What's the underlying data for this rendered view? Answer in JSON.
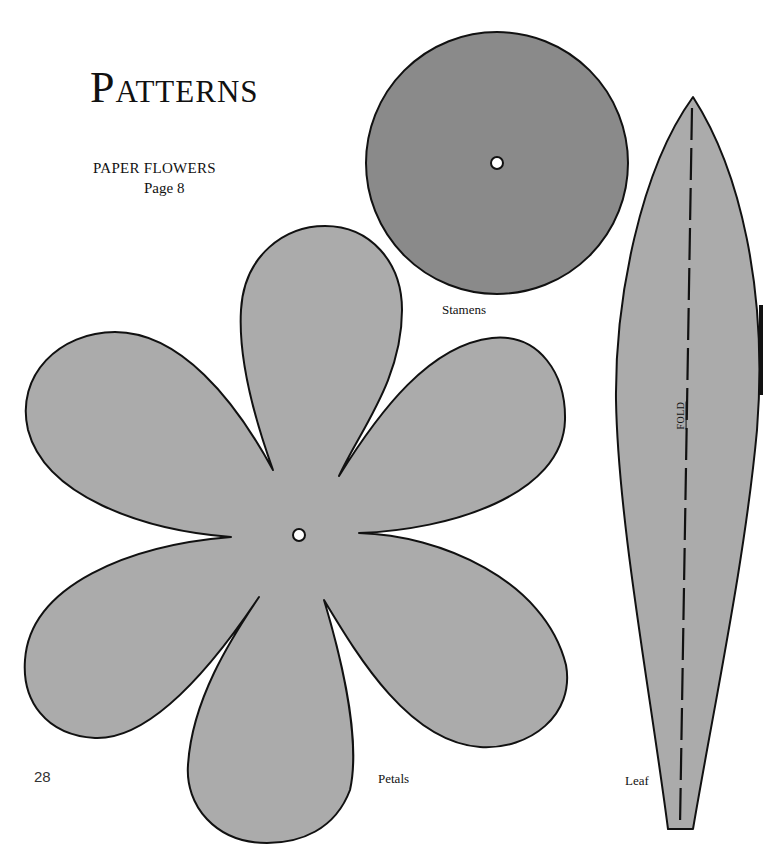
{
  "page": {
    "title": "Patterns",
    "subtitle": "PAPER FLOWERS",
    "page_reference": "Page 8",
    "page_number": "28"
  },
  "patterns": [
    {
      "id": "stamens",
      "label": "Stamens",
      "shape": "circle with center hole",
      "fill": "#8a8a8a"
    },
    {
      "id": "petals",
      "label": "Petals",
      "shape": "six-petal flower with center hole",
      "fill": "#ababab"
    },
    {
      "id": "leaf",
      "label": "Leaf",
      "shape": "elongated leaf with dashed fold line",
      "fill": "#ababab",
      "fold_label": "FOLD"
    }
  ],
  "colors": {
    "outline": "#111111",
    "stamens_fill": "#8a8a8a",
    "petals_fill": "#ababab",
    "leaf_fill": "#ababab",
    "background": "#ffffff"
  }
}
